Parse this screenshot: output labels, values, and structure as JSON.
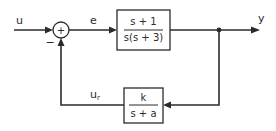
{
  "diagram": {
    "type": "feedback-control-block-diagram",
    "signals": {
      "input": "u",
      "error": "e",
      "output": "y",
      "feedback_main": "u",
      "feedback_sub": "r"
    },
    "summing_junction": {
      "plus_sign": "+",
      "minus_sign": "−"
    },
    "forward_block": {
      "numerator": "s + 1",
      "denominator": "s(s + 3)"
    },
    "feedback_block": {
      "numerator": "k",
      "denominator": "s + a"
    },
    "colors": {
      "line": "#2b2b2b",
      "background": "#ffffff"
    }
  }
}
